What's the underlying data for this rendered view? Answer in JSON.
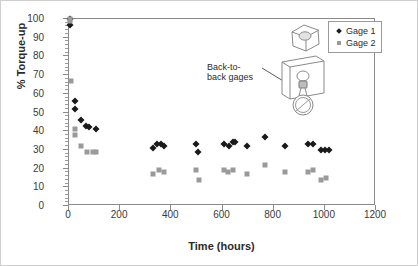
{
  "chart_data": {
    "type": "scatter",
    "title": "",
    "xlabel": "Time (hours)",
    "ylabel": "% Torque-up",
    "xlim": [
      0,
      1200
    ],
    "ylim": [
      0,
      100
    ],
    "xticks": [
      0,
      200,
      400,
      600,
      800,
      1000,
      1200
    ],
    "yticks": [
      0,
      10,
      20,
      30,
      40,
      50,
      60,
      70,
      80,
      90,
      100
    ],
    "y_minor_tick_step": 2,
    "grid": false,
    "legend_position": "top-right",
    "series": [
      {
        "name": "Gage 1",
        "marker": "diamond",
        "color": "#1a1a1a",
        "points": [
          [
            2,
            100
          ],
          [
            4,
            97
          ],
          [
            22,
            56
          ],
          [
            24,
            52
          ],
          [
            48,
            46
          ],
          [
            68,
            43
          ],
          [
            80,
            42
          ],
          [
            105,
            41
          ],
          [
            330,
            31
          ],
          [
            345,
            33
          ],
          [
            358,
            33
          ],
          [
            372,
            32
          ],
          [
            495,
            33
          ],
          [
            505,
            29
          ],
          [
            605,
            33
          ],
          [
            625,
            32
          ],
          [
            640,
            34
          ],
          [
            650,
            34
          ],
          [
            695,
            32
          ],
          [
            765,
            37
          ],
          [
            845,
            32
          ],
          [
            935,
            33
          ],
          [
            955,
            33
          ],
          [
            985,
            30
          ],
          [
            1000,
            30
          ],
          [
            1015,
            30
          ]
        ]
      },
      {
        "name": "Gage 2",
        "marker": "square",
        "color": "#9a9a9a",
        "points": [
          [
            2,
            100
          ],
          [
            4,
            99
          ],
          [
            6,
            67
          ],
          [
            22,
            41
          ],
          [
            24,
            38
          ],
          [
            48,
            32
          ],
          [
            72,
            29
          ],
          [
            92,
            29
          ],
          [
            105,
            29
          ],
          [
            330,
            17
          ],
          [
            352,
            19
          ],
          [
            370,
            18
          ],
          [
            495,
            19
          ],
          [
            510,
            14
          ],
          [
            605,
            19
          ],
          [
            622,
            18
          ],
          [
            640,
            19
          ],
          [
            695,
            17
          ],
          [
            765,
            22
          ],
          [
            845,
            18
          ],
          [
            935,
            18
          ],
          [
            952,
            19
          ],
          [
            985,
            14
          ],
          [
            1005,
            15
          ]
        ]
      }
    ]
  },
  "legend": {
    "items": [
      {
        "label": "Gage 1",
        "marker": "diamond"
      },
      {
        "label": "Gage 2",
        "marker": "square"
      }
    ]
  },
  "annotation": {
    "text_line_1": "Back-to-",
    "text_line_2": "back gages"
  }
}
